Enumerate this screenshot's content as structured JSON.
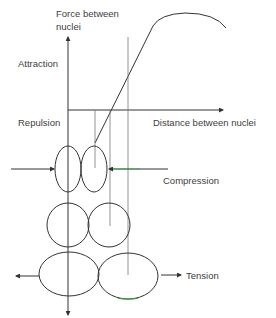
{
  "diagram": {
    "labels": {
      "y_axis_line1": "Force between",
      "y_axis_line2": "nuclei",
      "attraction": "Attraction",
      "repulsion": "Repulsion",
      "x_axis": "Distance between nuclei",
      "compression": "Compression",
      "tension": "Tension"
    },
    "colors": {
      "line": "#333333",
      "thin_line": "#7a7a7a",
      "accent_green": "#2eaa3a",
      "text": "#404040"
    },
    "stages": [
      {
        "name": "compression",
        "shape": "tall narrow ellipses",
        "force": "inward arrows"
      },
      {
        "name": "equilibrium",
        "shape": "circles",
        "force": "none"
      },
      {
        "name": "tension",
        "shape": "wide ellipses",
        "force": "outward arrows"
      }
    ]
  }
}
